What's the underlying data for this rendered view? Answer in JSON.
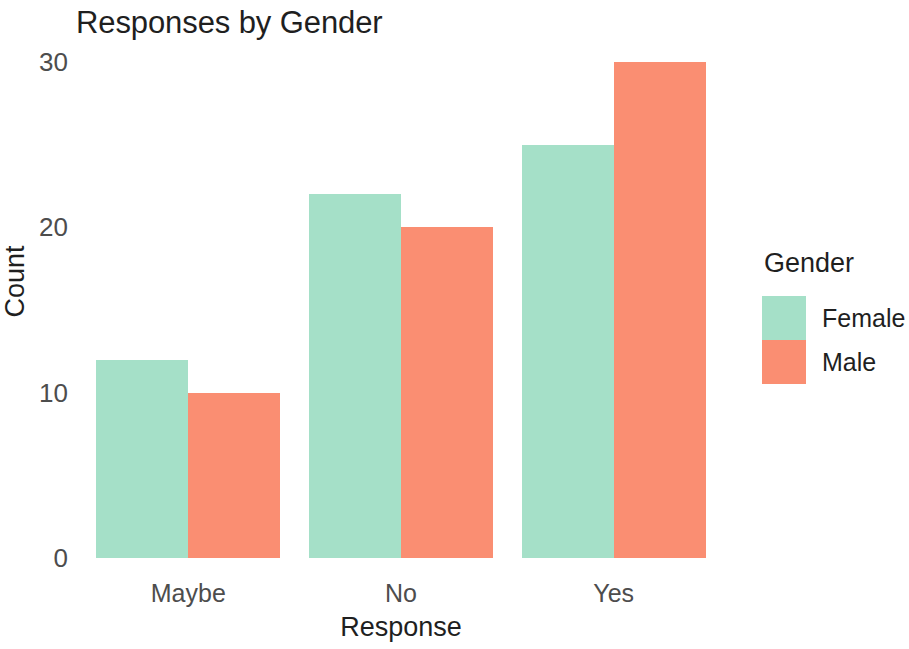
{
  "chart_data": {
    "type": "bar",
    "title": "Responses by Gender",
    "xlabel": "Response",
    "ylabel": "Count",
    "categories": [
      "Maybe",
      "No",
      "Yes"
    ],
    "series": [
      {
        "name": "Female",
        "values": [
          12,
          22,
          25
        ],
        "color": "#a5e0c8"
      },
      {
        "name": "Male",
        "values": [
          10,
          20,
          30
        ],
        "color": "#fa8e72"
      }
    ],
    "ylim": [
      0,
      30
    ],
    "yticks": [
      0,
      10,
      20,
      30
    ],
    "ytick_labels": [
      "0",
      "10",
      "20",
      "30"
    ],
    "grid": false,
    "legend": {
      "title": "Gender",
      "position": "right",
      "entries": [
        {
          "label": "Female",
          "color": "#a5e0c8"
        },
        {
          "label": "Male",
          "color": "#fa8e72"
        }
      ]
    },
    "background": "#ffffff",
    "bar_mode": "grouped"
  }
}
